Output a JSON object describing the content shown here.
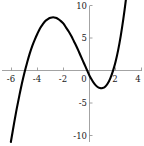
{
  "chart_data": {
    "type": "line",
    "title": "",
    "subtitle": "",
    "xlabel": "",
    "ylabel": "",
    "xlim": [
      -6.4,
      4.3
    ],
    "ylim": [
      -11.0,
      11.2
    ],
    "grid": false,
    "legend": null,
    "annotations": [],
    "axes": {
      "x_ticks": [
        -6,
        -4,
        -2,
        0,
        2,
        4
      ],
      "x_tick_labels": [
        "-6",
        "-4",
        "-2",
        "0",
        "2",
        "4"
      ],
      "y_ticks": [
        -10,
        -5,
        5,
        10
      ],
      "y_tick_labels": [
        "-10",
        "-5",
        "5",
        "10"
      ],
      "origin_label": "0",
      "x_axis_position_y": 0,
      "y_axis_position_x": 0
    },
    "series": [
      {
        "name": "cubic",
        "expression": "y = 0.5*(x + 5.2)*(x - 0.3)*(x - 1.8)",
        "color": "#000000",
        "x": [
          -6.05,
          -5.8,
          -5.6,
          -5.4,
          -5.2,
          -5.0,
          -4.8,
          -4.6,
          -4.4,
          -4.2,
          -4.0,
          -3.8,
          -3.6,
          -3.4,
          -3.2,
          -3.0,
          -2.8,
          -2.6,
          -2.4,
          -2.2,
          -2.0,
          -1.8,
          -1.6,
          -1.4,
          -1.2,
          -1.0,
          -0.8,
          -0.6,
          -0.4,
          -0.2,
          0.0,
          0.2,
          0.4,
          0.6,
          0.8,
          1.0,
          1.2,
          1.4,
          1.6,
          1.8,
          2.0,
          2.2,
          2.4,
          2.6,
          2.8,
          3.0,
          3.1
        ],
        "y": [
          -11.0,
          -8.1,
          -5.9,
          -3.9,
          -2.0,
          -0.3,
          1.2,
          2.6,
          3.8,
          4.8,
          5.7,
          6.5,
          7.1,
          7.6,
          7.9,
          8.1,
          8.2,
          8.1,
          7.9,
          7.6,
          7.2,
          6.6,
          6.0,
          5.3,
          4.5,
          3.7,
          2.8,
          1.9,
          1.0,
          0.1,
          -0.8,
          -1.5,
          -2.1,
          -2.5,
          -2.7,
          -2.7,
          -2.5,
          -2.0,
          -1.2,
          -0.1,
          1.3,
          3.1,
          5.3,
          7.9,
          10.9,
          14.4,
          16.2
        ],
        "features": {
          "local_maximum": {
            "x": -3.0,
            "y": 10.0
          },
          "local_minimum": {
            "x": 1.0,
            "y": -0.6
          },
          "roots": [
            -5.2,
            0.3,
            1.8
          ]
        }
      }
    ]
  }
}
